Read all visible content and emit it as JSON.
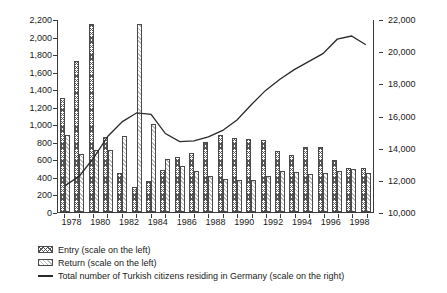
{
  "chart_data": {
    "type": "bar",
    "title": "",
    "subtitle": "",
    "xlabel": "",
    "ylabel": "",
    "y2label": "",
    "grid": false,
    "legend_position": "bottom-left",
    "categories": [
      "1978",
      "1979",
      "1980",
      "1981",
      "1982",
      "1983",
      "1984",
      "1985",
      "1986",
      "1987",
      "1988",
      "1989",
      "1990",
      "1991",
      "1992",
      "1993",
      "1994",
      "1995",
      "1996",
      "1997",
      "1998",
      "1999"
    ],
    "tick_categories": [
      "1978",
      "1980",
      "1982",
      "1984",
      "1986",
      "1988",
      "1990",
      "1992",
      "1994",
      "1996",
      "1998"
    ],
    "ylim": [
      0,
      2200
    ],
    "yticks": [
      0,
      200,
      400,
      600,
      800,
      1000,
      1200,
      1400,
      1600,
      1800,
      2000,
      2200
    ],
    "ytick_labels": [
      "0",
      "200",
      "400",
      "600",
      "800",
      "1,000",
      "1,200",
      "1,400",
      "1,600",
      "1,800",
      "2,000",
      "2,200"
    ],
    "y2lim": [
      10000,
      22000
    ],
    "y2ticks": [
      10000,
      12000,
      14000,
      16000,
      18000,
      20000,
      22000
    ],
    "y2tick_labels": [
      "10,000",
      "12,000",
      "14,000",
      "16,000",
      "18,000",
      "20,000",
      "22,000"
    ],
    "series": [
      {
        "name": "Entry (scale on the left)",
        "axis": "left",
        "type": "bar",
        "values": [
          1300,
          1720,
          2140,
          850,
          440,
          285,
          350,
          475,
          630,
          675,
          800,
          875,
          845,
          835,
          825,
          690,
          650,
          745,
          745,
          595,
          505,
          500
        ]
      },
      {
        "name": "Return (scale on the left)",
        "axis": "left",
        "type": "bar",
        "values": [
          880,
          660,
          710,
          710,
          865,
          2140,
          1000,
          610,
          520,
          470,
          405,
          380,
          370,
          370,
          415,
          470,
          460,
          435,
          450,
          470,
          485,
          440
        ]
      },
      {
        "name": "Total number of Turkish citizens residing in Germany (scale on the right)",
        "axis": "right",
        "type": "line",
        "values": [
          11650,
          12250,
          13400,
          14750,
          15650,
          16200,
          16100,
          14900,
          14400,
          14450,
          14700,
          15100,
          15750,
          16700,
          17600,
          18300,
          18900,
          19400,
          19900,
          20800,
          21000,
          20450
        ]
      }
    ]
  },
  "legend": {
    "entry_label": "Entry (scale on the left)",
    "return_label": "Return (scale on the left)",
    "line_label": "Total number of Turkish citizens residing in Germany (scale on the right)"
  }
}
